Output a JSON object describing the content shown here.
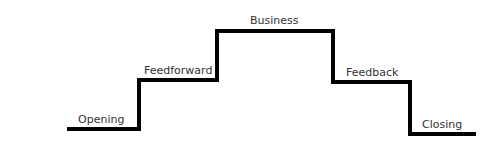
{
  "diagram": {
    "type": "staircase",
    "line_color": "#000000",
    "text_color": "#333333",
    "stages": [
      {
        "label": "Opening",
        "level": 1
      },
      {
        "label": "Feedforward",
        "level": 2
      },
      {
        "label": "Business",
        "level": 3
      },
      {
        "label": "Feedback",
        "level": 2
      },
      {
        "label": "Closing",
        "level": 0
      }
    ]
  }
}
